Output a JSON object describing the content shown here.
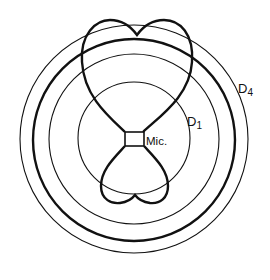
{
  "diagram": {
    "type": "microphone polar pickup pattern with distance circles",
    "center": {
      "x": 134,
      "y": 138
    },
    "circles": [
      {
        "name": "D1",
        "r": 56,
        "stroke_width": 1.1
      },
      {
        "name": "circle-2",
        "r": 85,
        "stroke_width": 1.1
      },
      {
        "name": "circle-3-bold",
        "r": 101,
        "stroke_width": 2.4
      },
      {
        "name": "D4",
        "r": 114,
        "stroke_width": 1.1
      }
    ],
    "labels": {
      "mic": "Mic.",
      "d1_main": "D",
      "d1_sub": "1",
      "d4_main": "D",
      "d4_sub": "4"
    },
    "colors": {
      "line": "#111111",
      "background": "#ffffff"
    }
  }
}
